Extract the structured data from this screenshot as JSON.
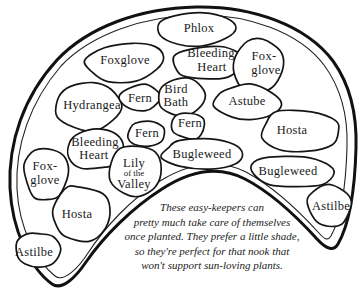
{
  "diagram": {
    "colors": {
      "ink": "#1a1a1a",
      "background": "#ffffff"
    },
    "regions": [
      {
        "id": "phlox",
        "label": "Phlox"
      },
      {
        "id": "foxglove-top-left",
        "label": "Foxglove"
      },
      {
        "id": "bleeding-heart-top",
        "lines": [
          "Bleeding",
          "Heart"
        ]
      },
      {
        "id": "foxglove-top-right",
        "lines": [
          "Fox-",
          "glove"
        ]
      },
      {
        "id": "hydrangea",
        "label": "Hydrangea"
      },
      {
        "id": "fern-upper-left",
        "label": "Fern"
      },
      {
        "id": "bird-bath",
        "lines": [
          "Bird",
          "Bath"
        ]
      },
      {
        "id": "astube",
        "label": "Astube"
      },
      {
        "id": "fern-center",
        "label": "Fern"
      },
      {
        "id": "fern-lower-left",
        "label": "Fern"
      },
      {
        "id": "hosta-right",
        "label": "Hosta"
      },
      {
        "id": "bleeding-heart-left",
        "lines": [
          "Bleeding",
          "Heart"
        ]
      },
      {
        "id": "lily-of-the-valley",
        "lines": [
          "Lily",
          "of the",
          "Valley"
        ]
      },
      {
        "id": "bugleweed-center",
        "label": "Bugleweed"
      },
      {
        "id": "foxglove-left",
        "lines": [
          "Fox-",
          "glove"
        ]
      },
      {
        "id": "bugleweed-right",
        "label": "Bugleweed"
      },
      {
        "id": "hosta-bottom-left",
        "label": "Hosta"
      },
      {
        "id": "astilbe-right",
        "label": "Astilbe"
      },
      {
        "id": "astilbe-left",
        "label": "Astilbe"
      }
    ],
    "caption": {
      "lines": [
        "These easy-keepers can",
        "pretty much take care of themselves",
        "once planted. They prefer a little shade,",
        "so they're perfect for that nook that",
        "won't support sun-loving plants."
      ]
    }
  }
}
